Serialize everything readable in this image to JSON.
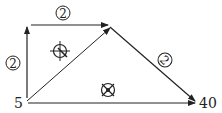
{
  "diagram": {
    "nodes": {
      "source": {
        "label": "5"
      },
      "sink": {
        "label": "40"
      }
    },
    "edge_labels": {
      "top": "2",
      "left": "2",
      "right_diagonal": "2"
    },
    "symbols": [
      {
        "name": "circled-cross-symbol",
        "position": "upper-triangle"
      },
      {
        "name": "circled-x-symbol",
        "position": "lower-triangle"
      }
    ],
    "colors": {
      "stroke": "#222222",
      "background": "#ffffff"
    }
  }
}
